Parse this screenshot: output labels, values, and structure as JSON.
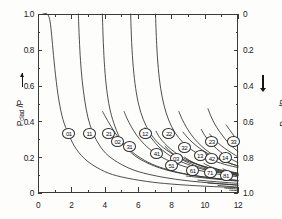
{
  "figure": {
    "kind": "scientific-line-plot",
    "background": "#fdfdfc",
    "curve_color": "#2f2f2d",
    "axis_color": "#3a3a38"
  },
  "axes": {
    "left": {
      "title_main": "P",
      "title_sub": "clad",
      "title_tail": " /P",
      "arrow": "up-arrow-icon",
      "ticks": [
        "0",
        "0.2",
        "0.4",
        "0.6",
        "0.8",
        "1.0"
      ],
      "range": [
        0,
        1
      ]
    },
    "right": {
      "title_main": "P",
      "title_sub": "core",
      "title_tail": " /P",
      "arrow": "down-arrow-icon",
      "ticks": [
        "0",
        "0.2",
        "0.4",
        "0.6",
        "0.8",
        "1.0"
      ],
      "range": [
        1,
        0
      ]
    },
    "bottom": {
      "ticks": [
        "0",
        "2",
        "4",
        "6",
        "8",
        "10",
        "12"
      ],
      "range": [
        0,
        12
      ]
    }
  },
  "chart_data": {
    "type": "line",
    "title": "",
    "xlabel": "",
    "ylabel": "P_clad /P",
    "y2label": "P_core /P",
    "xlim": [
      0,
      12
    ],
    "ylim": [
      0,
      1
    ],
    "y2lim": [
      1,
      0
    ],
    "grid": false,
    "legend": "inline-mode-labels",
    "xticks": [
      0,
      2,
      4,
      6,
      8,
      10,
      12
    ],
    "yticks": [
      0,
      0.2,
      0.4,
      0.6,
      0.8,
      1.0
    ],
    "y2ticks": [
      0,
      0.2,
      0.4,
      0.6,
      0.8,
      1.0
    ],
    "series": [
      {
        "name": "01",
        "cutoff": 0.0,
        "label_x": 1.85,
        "label_y": 0.335,
        "points": [
          [
            0.3,
            1.0
          ],
          [
            0.55,
            1.0
          ],
          [
            0.7,
            0.97
          ],
          [
            0.8,
            0.9
          ],
          [
            0.9,
            0.8
          ],
          [
            1.05,
            0.66
          ],
          [
            1.25,
            0.52
          ],
          [
            1.5,
            0.41
          ],
          [
            1.85,
            0.325
          ],
          [
            2.3,
            0.245
          ],
          [
            3.0,
            0.175
          ],
          [
            4.0,
            0.12
          ],
          [
            5.0,
            0.09
          ],
          [
            6.5,
            0.065
          ],
          [
            8.0,
            0.05
          ],
          [
            10.0,
            0.038
          ],
          [
            12.0,
            0.03
          ]
        ]
      },
      {
        "name": "11",
        "cutoff": 2.405,
        "label_x": 3.07,
        "label_y": 0.335,
        "points": [
          [
            2.42,
            1.0
          ],
          [
            2.48,
            0.86
          ],
          [
            2.55,
            0.74
          ],
          [
            2.65,
            0.63
          ],
          [
            2.8,
            0.52
          ],
          [
            3.0,
            0.42
          ],
          [
            3.3,
            0.335
          ],
          [
            3.7,
            0.265
          ],
          [
            4.2,
            0.21
          ],
          [
            5.0,
            0.16
          ],
          [
            6.0,
            0.12
          ],
          [
            7.5,
            0.088
          ],
          [
            9.0,
            0.068
          ],
          [
            10.5,
            0.055
          ],
          [
            12.0,
            0.045
          ]
        ]
      },
      {
        "name": "21",
        "cutoff": 3.832,
        "label_x": 4.25,
        "label_y": 0.335,
        "points": [
          [
            3.86,
            1.0
          ],
          [
            3.92,
            0.84
          ],
          [
            4.0,
            0.7
          ],
          [
            4.12,
            0.58
          ],
          [
            4.3,
            0.475
          ],
          [
            4.55,
            0.39
          ],
          [
            4.9,
            0.31
          ],
          [
            5.35,
            0.248
          ],
          [
            6.0,
            0.196
          ],
          [
            7.0,
            0.15
          ],
          [
            8.2,
            0.117
          ],
          [
            9.6,
            0.094
          ],
          [
            11.0,
            0.078
          ],
          [
            12.0,
            0.07
          ]
        ]
      },
      {
        "name": "02",
        "cutoff": 3.832,
        "label_x": 4.77,
        "label_y": 0.29,
        "points": [
          [
            3.88,
            0.455
          ],
          [
            4.05,
            0.425
          ],
          [
            4.3,
            0.385
          ],
          [
            4.6,
            0.34
          ],
          [
            4.95,
            0.295
          ],
          [
            5.4,
            0.25
          ],
          [
            6.0,
            0.205
          ],
          [
            6.8,
            0.163
          ],
          [
            7.8,
            0.13
          ],
          [
            9.0,
            0.104
          ],
          [
            10.5,
            0.083
          ],
          [
            12.0,
            0.07
          ]
        ]
      },
      {
        "name": "31",
        "cutoff": 5.136,
        "label_x": 5.48,
        "label_y": 0.262,
        "points": [
          [
            5.17,
            0.455
          ],
          [
            5.35,
            0.415
          ],
          [
            5.6,
            0.37
          ],
          [
            5.9,
            0.325
          ],
          [
            6.3,
            0.28
          ],
          [
            6.8,
            0.238
          ],
          [
            7.5,
            0.196
          ],
          [
            8.4,
            0.16
          ],
          [
            9.5,
            0.13
          ],
          [
            10.7,
            0.107
          ],
          [
            12.0,
            0.09
          ]
        ]
      },
      {
        "name": "12",
        "cutoff": 5.52,
        "label_x": 6.42,
        "label_y": 0.335,
        "points": [
          [
            5.56,
            1.0
          ],
          [
            5.62,
            0.84
          ],
          [
            5.72,
            0.7
          ],
          [
            5.86,
            0.585
          ],
          [
            6.05,
            0.49
          ],
          [
            6.32,
            0.41
          ],
          [
            6.7,
            0.34
          ],
          [
            7.2,
            0.28
          ],
          [
            7.9,
            0.228
          ],
          [
            8.8,
            0.184
          ],
          [
            10.0,
            0.148
          ],
          [
            11.2,
            0.124
          ],
          [
            12.0,
            0.112
          ]
        ]
      },
      {
        "name": "41",
        "cutoff": 6.38,
        "label_x": 7.12,
        "label_y": 0.218,
        "points": [
          [
            6.42,
            0.365
          ],
          [
            6.62,
            0.33
          ],
          [
            6.9,
            0.295
          ],
          [
            7.25,
            0.258
          ],
          [
            7.7,
            0.222
          ],
          [
            8.25,
            0.19
          ],
          [
            8.95,
            0.161
          ],
          [
            9.8,
            0.135
          ],
          [
            10.9,
            0.113
          ],
          [
            12.0,
            0.098
          ]
        ]
      },
      {
        "name": "22",
        "cutoff": 7.016,
        "label_x": 7.85,
        "label_y": 0.335,
        "points": [
          [
            7.05,
            1.0
          ],
          [
            7.12,
            0.83
          ],
          [
            7.22,
            0.695
          ],
          [
            7.36,
            0.585
          ],
          [
            7.56,
            0.49
          ],
          [
            7.84,
            0.408
          ],
          [
            8.2,
            0.34
          ],
          [
            8.7,
            0.282
          ],
          [
            9.35,
            0.233
          ],
          [
            10.2,
            0.192
          ],
          [
            11.2,
            0.16
          ],
          [
            12.0,
            0.142
          ]
        ]
      },
      {
        "name": "03",
        "cutoff": 7.016,
        "label_x": 8.28,
        "label_y": 0.195,
        "points": [
          [
            7.08,
            0.345
          ],
          [
            7.3,
            0.31
          ],
          [
            7.6,
            0.277
          ],
          [
            7.98,
            0.244
          ],
          [
            8.45,
            0.212
          ],
          [
            9.0,
            0.183
          ],
          [
            9.7,
            0.156
          ],
          [
            10.5,
            0.133
          ],
          [
            11.3,
            0.116
          ],
          [
            12.0,
            0.104
          ]
        ]
      },
      {
        "name": "51",
        "cutoff": 7.588,
        "label_x": 8.0,
        "label_y": 0.152,
        "points": [
          [
            7.62,
            0.262
          ],
          [
            7.85,
            0.238
          ],
          [
            8.15,
            0.216
          ],
          [
            8.5,
            0.194
          ],
          [
            8.95,
            0.172
          ],
          [
            9.5,
            0.151
          ],
          [
            10.15,
            0.132
          ],
          [
            10.9,
            0.116
          ],
          [
            11.6,
            0.104
          ],
          [
            12.0,
            0.098
          ]
        ]
      },
      {
        "name": "32",
        "cutoff": 8.417,
        "label_x": 8.77,
        "label_y": 0.252,
        "points": [
          [
            8.45,
            0.455
          ],
          [
            8.65,
            0.412
          ],
          [
            8.9,
            0.368
          ],
          [
            9.2,
            0.325
          ],
          [
            9.58,
            0.283
          ],
          [
            10.05,
            0.243
          ],
          [
            10.6,
            0.207
          ],
          [
            11.25,
            0.176
          ],
          [
            12.0,
            0.15
          ]
        ]
      },
      {
        "name": "61",
        "cutoff": 8.771,
        "label_x": 9.28,
        "label_y": 0.125,
        "points": [
          [
            8.8,
            0.2
          ],
          [
            9.05,
            0.184
          ],
          [
            9.35,
            0.169
          ],
          [
            9.7,
            0.154
          ],
          [
            10.1,
            0.14
          ],
          [
            10.55,
            0.127
          ],
          [
            11.05,
            0.116
          ],
          [
            11.55,
            0.107
          ],
          [
            12.0,
            0.1
          ]
        ]
      },
      {
        "name": "13",
        "cutoff": 8.654,
        "label_x": 9.72,
        "label_y": 0.208,
        "points": [
          [
            8.7,
            0.34
          ],
          [
            8.95,
            0.312
          ],
          [
            9.25,
            0.284
          ],
          [
            9.6,
            0.257
          ],
          [
            10.0,
            0.231
          ],
          [
            10.45,
            0.207
          ],
          [
            10.95,
            0.185
          ],
          [
            11.5,
            0.166
          ],
          [
            12.0,
            0.152
          ]
        ]
      },
      {
        "name": "42",
        "cutoff": 9.761,
        "label_x": 10.42,
        "label_y": 0.19,
        "points": [
          [
            9.8,
            0.355
          ],
          [
            10.0,
            0.322
          ],
          [
            10.25,
            0.292
          ],
          [
            10.55,
            0.262
          ],
          [
            10.9,
            0.233
          ],
          [
            11.3,
            0.206
          ],
          [
            11.7,
            0.184
          ],
          [
            12.0,
            0.17
          ]
        ]
      },
      {
        "name": "71",
        "cutoff": 9.936,
        "label_x": 10.32,
        "label_y": 0.112,
        "points": [
          [
            9.96,
            0.165
          ],
          [
            10.2,
            0.153
          ],
          [
            10.5,
            0.142
          ],
          [
            10.85,
            0.131
          ],
          [
            11.25,
            0.121
          ],
          [
            11.65,
            0.113
          ],
          [
            12.0,
            0.107
          ]
        ]
      },
      {
        "name": "23",
        "cutoff": 10.174,
        "label_x": 10.42,
        "label_y": 0.29,
        "points": [
          [
            10.2,
            0.47
          ],
          [
            10.38,
            0.428
          ],
          [
            10.6,
            0.386
          ],
          [
            10.88,
            0.345
          ],
          [
            11.2,
            0.305
          ],
          [
            11.55,
            0.268
          ],
          [
            12.0,
            0.232
          ]
        ]
      },
      {
        "name": "14",
        "cutoff": 11.62,
        "label_x": 11.22,
        "label_y": 0.198,
        "points": [
          [
            10.3,
            0.33
          ],
          [
            10.55,
            0.303
          ],
          [
            10.85,
            0.276
          ],
          [
            11.2,
            0.25
          ],
          [
            11.6,
            0.225
          ],
          [
            12.0,
            0.202
          ]
        ]
      },
      {
        "name": "81",
        "cutoff": 11.086,
        "label_x": 11.28,
        "label_y": 0.095,
        "points": [
          [
            11.1,
            0.135
          ],
          [
            11.3,
            0.127
          ],
          [
            11.55,
            0.119
          ],
          [
            11.8,
            0.112
          ],
          [
            12.0,
            0.107
          ]
        ]
      },
      {
        "name": "33",
        "cutoff": 11.62,
        "label_x": 11.72,
        "label_y": 0.288,
        "points": [
          [
            11.3,
            0.38
          ],
          [
            11.48,
            0.355
          ],
          [
            11.68,
            0.33
          ],
          [
            11.85,
            0.308
          ],
          [
            12.0,
            0.29
          ]
        ]
      },
      {
        "name": "tail-a",
        "cutoff": 0,
        "label_x": null,
        "label_y": null,
        "points": [
          [
            8.9,
            0.095
          ],
          [
            9.6,
            0.088
          ],
          [
            10.4,
            0.08
          ],
          [
            11.2,
            0.073
          ],
          [
            12.0,
            0.066
          ]
        ]
      },
      {
        "name": "tail-b",
        "cutoff": 0,
        "label_x": null,
        "label_y": null,
        "points": [
          [
            9.6,
            0.072
          ],
          [
            10.3,
            0.066
          ],
          [
            11.1,
            0.06
          ],
          [
            12.0,
            0.054
          ]
        ]
      },
      {
        "name": "tail-c",
        "cutoff": 0,
        "label_x": null,
        "label_y": null,
        "points": [
          [
            10.2,
            0.056
          ],
          [
            10.9,
            0.051
          ],
          [
            11.5,
            0.047
          ],
          [
            12.0,
            0.043
          ]
        ]
      },
      {
        "name": "tail-d",
        "cutoff": 0,
        "label_x": null,
        "label_y": null,
        "points": [
          [
            10.8,
            0.042
          ],
          [
            11.3,
            0.038
          ],
          [
            11.7,
            0.035
          ],
          [
            12.0,
            0.033
          ]
        ]
      },
      {
        "name": "tail-e",
        "cutoff": 0,
        "label_x": null,
        "label_y": null,
        "points": [
          [
            11.2,
            0.028
          ],
          [
            11.6,
            0.025
          ],
          [
            12.0,
            0.022
          ]
        ]
      },
      {
        "name": "tail-f",
        "cutoff": 0,
        "label_x": null,
        "label_y": null,
        "points": [
          [
            11.5,
            0.016
          ],
          [
            11.8,
            0.014
          ],
          [
            12.0,
            0.012
          ]
        ]
      }
    ]
  }
}
